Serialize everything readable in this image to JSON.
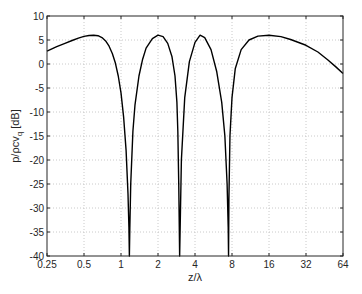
{
  "chart_data": {
    "type": "line",
    "title": "",
    "xlabel": "z/λ",
    "ylabel": "p/ρcv_q [dB]",
    "xscale": "log2",
    "xlim": [
      0.25,
      64
    ],
    "ylim": [
      -40,
      10
    ],
    "grid": true,
    "legend": null,
    "x_ticks": [
      0.25,
      0.5,
      1,
      2,
      4,
      8,
      16,
      32,
      64
    ],
    "x_tick_labels": [
      "0.25",
      "0.5",
      "1",
      "2",
      "4",
      "8",
      "16",
      "32",
      "64"
    ],
    "y_ticks": [
      10,
      5,
      0,
      -5,
      -10,
      -15,
      -20,
      -25,
      -30,
      -35,
      -40
    ],
    "y_tick_labels": [
      "10",
      "5",
      "0",
      "-5",
      "-10",
      "-15",
      "-20",
      "-25",
      "-30",
      "-35",
      "-40"
    ],
    "series": [
      {
        "name": "pressure level",
        "color": "#000000",
        "x": [
          0.25,
          0.3,
          0.35,
          0.4,
          0.45,
          0.5,
          0.55,
          0.6,
          0.65,
          0.7,
          0.75,
          0.8,
          0.85,
          0.9,
          0.95,
          1.0,
          1.05,
          1.1,
          1.14,
          1.16,
          1.17,
          1.18,
          1.2,
          1.25,
          1.3,
          1.4,
          1.5,
          1.6,
          1.8,
          2.0,
          2.2,
          2.4,
          2.6,
          2.75,
          2.85,
          2.9,
          2.95,
          3.0,
          3.1,
          3.3,
          3.6,
          4.0,
          4.4,
          4.8,
          5.4,
          6.0,
          6.6,
          7.0,
          7.3,
          7.45,
          7.5,
          7.55,
          7.7,
          8.0,
          8.5,
          9.5,
          11,
          13,
          16,
          20,
          24,
          32,
          40,
          48,
          56,
          64
        ],
        "y": [
          2.7,
          3.6,
          4.3,
          4.9,
          5.4,
          5.75,
          5.95,
          6.0,
          5.9,
          5.5,
          4.8,
          3.7,
          2.2,
          0.2,
          -2.5,
          -6.0,
          -11.0,
          -18.0,
          -27.0,
          -34.0,
          -40.0,
          -34.0,
          -25.0,
          -14.0,
          -8.5,
          -2.5,
          1.0,
          3.3,
          5.3,
          6.0,
          5.7,
          4.3,
          1.5,
          -2.5,
          -8.0,
          -14.0,
          -25.0,
          -40.0,
          -20.0,
          -7.0,
          0.5,
          4.5,
          6.0,
          5.5,
          3.0,
          -1.5,
          -8.0,
          -15.0,
          -25.0,
          -34.0,
          -40.0,
          -28.0,
          -15.0,
          -7.0,
          -1.0,
          3.0,
          5.0,
          5.8,
          6.0,
          5.7,
          5.1,
          3.9,
          2.5,
          0.9,
          -0.6,
          -2.0
        ]
      }
    ]
  }
}
